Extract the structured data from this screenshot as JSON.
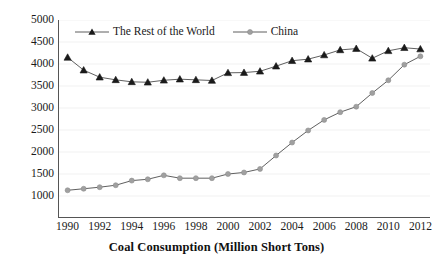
{
  "chart_data": {
    "type": "line",
    "title": "",
    "xlabel": "Coal Consumption (Million Short Tons)",
    "ylabel": "",
    "x": [
      1990,
      1991,
      1992,
      1993,
      1994,
      1995,
      1996,
      1997,
      1998,
      1999,
      2000,
      2001,
      2002,
      2003,
      2004,
      2005,
      2006,
      2007,
      2008,
      2009,
      2010,
      2011,
      2012
    ],
    "xlim": [
      1989.4,
      2012.6
    ],
    "ylim": [
      500,
      5000
    ],
    "xticks": [
      1990,
      1992,
      1994,
      1996,
      1998,
      2000,
      2002,
      2004,
      2006,
      2008,
      2010,
      2012
    ],
    "xticklabels": [
      "1990",
      "1992",
      "1994",
      "1996",
      "1998",
      "2000",
      "2002",
      "2004",
      "2006",
      "2008",
      "2010",
      "2012"
    ],
    "yticks": [
      1000,
      1500,
      2000,
      2500,
      3000,
      3500,
      4000,
      4500,
      5000
    ],
    "yticklabels": [
      "1000",
      "1500",
      "2000",
      "2500",
      "3000",
      "3500",
      "4000",
      "4500",
      "5000"
    ],
    "grid": true,
    "grid_axis": "y",
    "legend_position": "top-left-inside",
    "series": [
      {
        "name": "The Rest of the World",
        "color": "#1a1a1a",
        "marker": "triangle",
        "values": [
          4150,
          3860,
          3700,
          3640,
          3595,
          3585,
          3630,
          3655,
          3640,
          3625,
          3800,
          3805,
          3835,
          3950,
          4075,
          4110,
          4205,
          4320,
          4350,
          4130,
          4300,
          4370,
          4340
        ]
      },
      {
        "name": "China",
        "color": "#a0a0a0",
        "marker": "circle",
        "values": [
          1130,
          1165,
          1200,
          1245,
          1350,
          1380,
          1470,
          1405,
          1405,
          1405,
          1500,
          1535,
          1615,
          1920,
          2215,
          2490,
          2730,
          2905,
          3030,
          3340,
          3630,
          3985,
          4175
        ]
      }
    ]
  },
  "axes": {
    "xaxis_title": "Coal Consumption (Million Short Tons)"
  },
  "legend": {
    "items": [
      {
        "label": "The Rest of the World",
        "marker": "triangle-marker",
        "color": "#1a1a1a"
      },
      {
        "label": "China",
        "marker": "circle-marker",
        "color": "#a0a0a0"
      }
    ]
  }
}
